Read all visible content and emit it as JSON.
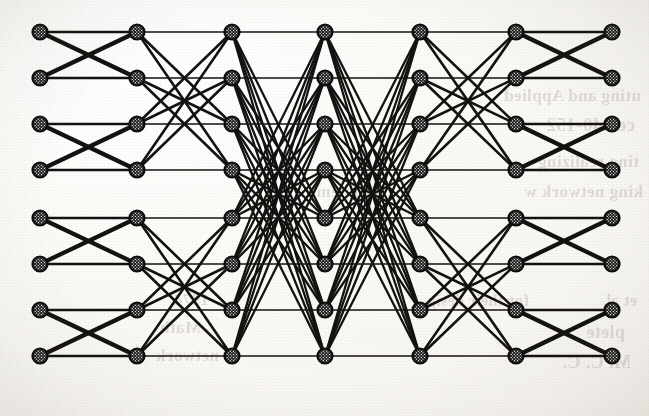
{
  "figure": {
    "kind": "interconnection-network-diagram",
    "caption_visible": false,
    "background_color": "#fdfdfb",
    "ink_color": "#141210",
    "node_fill_color": "#ffffff",
    "node_border_color": "#0d0c0a"
  },
  "graph": {
    "columns": 7,
    "rows": 8,
    "node_count": 56,
    "node_radius": 8.6,
    "node_style": "crosshatch-filled-circle",
    "column_x": [
      40,
      137,
      232,
      325,
      420,
      516,
      612
    ],
    "row_y": [
      32,
      78,
      124,
      170,
      218,
      264,
      310,
      356
    ],
    "stage_patterns": [
      {
        "from": 1,
        "to": 2,
        "pattern": "butterfly-distance-1",
        "block_size": 2,
        "stroke_width": 4.2
      },
      {
        "from": 2,
        "to": 3,
        "pattern": "butterfly-distance-2",
        "block_size": 4,
        "stroke_width": 2.6
      },
      {
        "from": 3,
        "to": 4,
        "pattern": "butterfly-distance-4",
        "block_size": 8,
        "stroke_width": 2.3
      },
      {
        "from": 4,
        "to": 5,
        "pattern": "butterfly-distance-4",
        "block_size": 8,
        "stroke_width": 2.3
      },
      {
        "from": 5,
        "to": 6,
        "pattern": "butterfly-distance-2",
        "block_size": 4,
        "stroke_width": 2.6
      },
      {
        "from": 6,
        "to": 7,
        "pattern": "butterfly-distance-1",
        "block_size": 2,
        "stroke_width": 4.2
      }
    ]
  },
  "bleed_through": {
    "description": "faint mirrored text showing through from the reverse side of the scanned page",
    "opacity": 0.185,
    "lines": [
      {
        "text": "uting and Applied",
        "x": 8,
        "y": 86,
        "size": 17
      },
      {
        "text": "ce 140-152",
        "x": 14,
        "y": 114,
        "size": 19
      },
      {
        "text": "ting realizing",
        "x": 10,
        "y": 152,
        "size": 17
      },
      {
        "text": "king network w",
        "x": 6,
        "y": 182,
        "size": 17
      },
      {
        "text": "Problems o",
        "x": 268,
        "y": 182,
        "size": 17
      },
      {
        "text": "et al.",
        "x": 12,
        "y": 292,
        "size": 16
      },
      {
        "text": "for their desig",
        "x": 120,
        "y": 292,
        "size": 16
      },
      {
        "text": "plete",
        "x": 24,
        "y": 322,
        "size": 18
      },
      {
        "text": "M. C. C.",
        "x": 18,
        "y": 352,
        "size": 18
      },
      {
        "text": "network",
        "x": 430,
        "y": 346,
        "size": 17
      },
      {
        "text": "Math",
        "x": 448,
        "y": 318,
        "size": 17
      },
      {
        "text": "1974",
        "x": 440,
        "y": 290,
        "size": 17
      }
    ]
  }
}
